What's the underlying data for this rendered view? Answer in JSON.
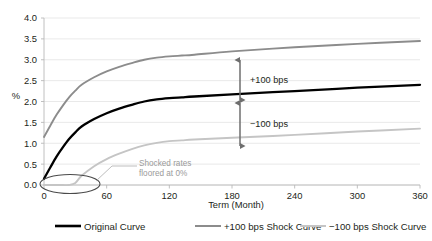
{
  "chart_data": {
    "type": "line",
    "title": "",
    "subtitle": "",
    "xlabel": "Term (Month)",
    "ylabel": "%",
    "xlim": [
      0,
      360
    ],
    "ylim": [
      0,
      4.0
    ],
    "grid": true,
    "legend_position": "bottom",
    "x_ticks": [
      "0",
      "60",
      "120",
      "180",
      "240",
      "300",
      "360"
    ],
    "x_tick_values": [
      0,
      60,
      120,
      180,
      240,
      300,
      360
    ],
    "y_ticks": [
      "0.0",
      "0.5",
      "1.0",
      "1.5",
      "2.0",
      "2.5",
      "3.0",
      "3.5",
      "4.0"
    ],
    "y_tick_values": [
      0.0,
      0.5,
      1.0,
      1.5,
      2.0,
      2.5,
      3.0,
      3.5,
      4.0
    ],
    "x": [
      0,
      6,
      12,
      18,
      24,
      30,
      36,
      48,
      60,
      72,
      84,
      96,
      108,
      120,
      132,
      144,
      180,
      240,
      300,
      360
    ],
    "series": [
      {
        "name": "Original Curve",
        "color": "#000000",
        "width": 2.3,
        "values": [
          0.15,
          0.42,
          0.68,
          0.9,
          1.1,
          1.26,
          1.4,
          1.58,
          1.72,
          1.83,
          1.92,
          2.0,
          2.05,
          2.08,
          2.1,
          2.12,
          2.17,
          2.25,
          2.33,
          2.4
        ]
      },
      {
        "name": "+100 bps Shock Curve",
        "color": "#8c8c8c",
        "width": 1.9,
        "values": [
          1.15,
          1.42,
          1.68,
          1.9,
          2.1,
          2.26,
          2.4,
          2.58,
          2.72,
          2.83,
          2.92,
          3.0,
          3.05,
          3.08,
          3.1,
          3.12,
          3.2,
          3.3,
          3.38,
          3.45
        ]
      },
      {
        "name": "−100 bps Shock Curve",
        "color": "#c5c5c5",
        "width": 1.9,
        "values": [
          0.0,
          0.0,
          0.0,
          0.0,
          0.0,
          0.05,
          0.22,
          0.45,
          0.62,
          0.75,
          0.86,
          0.95,
          1.01,
          1.05,
          1.07,
          1.09,
          1.13,
          1.2,
          1.28,
          1.35
        ]
      }
    ],
    "annotations": [
      {
        "name": "shocked-rates-note",
        "text_line1": "Shocked rates",
        "text_line2": "floored at 0%",
        "color": "#9a9a9a"
      },
      {
        "name": "plus-100-bps-arrow",
        "text": "+100 bps",
        "from_value": 2.1,
        "to_value": 3.1,
        "at_x": 210
      },
      {
        "name": "minus-100-bps-arrow",
        "text": "−100 bps",
        "from_value": 1.06,
        "to_value": 2.1,
        "at_x": 210
      }
    ],
    "highlight_ellipse": {
      "name": "origin-floor-highlight",
      "center_x": 22,
      "center_y": 0.02,
      "label": "origin floor region"
    }
  },
  "legend": {
    "items": [
      {
        "label": "Original Curve",
        "color": "#000000",
        "width": 2.6
      },
      {
        "label": "+100 bps Shock Curve",
        "color": "#8c8c8c",
        "width": 2.0
      },
      {
        "label": "−100 bps Shock Curve",
        "color": "#c5c5c5",
        "width": 2.0
      }
    ]
  },
  "axes": {
    "y_axis_label": "%",
    "x_axis_label": "Term (Month)"
  }
}
